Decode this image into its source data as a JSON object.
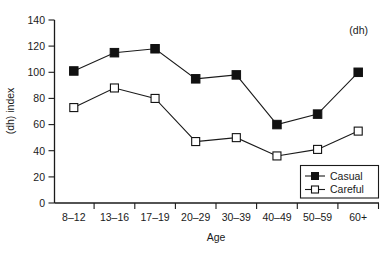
{
  "chart_data": {
    "type": "line",
    "title": "",
    "subtitle": "",
    "annotation": "(dh)",
    "xlabel": "Age",
    "ylabel": "(dh) index",
    "categories": [
      "8–12",
      "13–16",
      "17–19",
      "20–29",
      "30–39",
      "40–49",
      "50–59",
      "60+"
    ],
    "ylim": [
      0,
      140
    ],
    "ytick_step": 20,
    "ytick_labels": [
      "0",
      "20",
      "40",
      "60",
      "80",
      "100",
      "120",
      "140"
    ],
    "grid": false,
    "legend_position": "bottom-right",
    "series": [
      {
        "name": "Casual",
        "marker": "filled-square",
        "values": [
          101,
          115,
          118,
          95,
          98,
          60,
          68,
          100
        ]
      },
      {
        "name": "Careful",
        "marker": "open-square",
        "values": [
          73,
          88,
          80,
          47,
          50,
          36,
          41,
          55
        ]
      }
    ]
  },
  "legend": {
    "entries": [
      {
        "label": "Casual"
      },
      {
        "label": "Careful"
      }
    ]
  },
  "axes": {
    "y_title": "(dh) index",
    "x_title": "Age"
  },
  "panel": {
    "label": "(dh)"
  }
}
